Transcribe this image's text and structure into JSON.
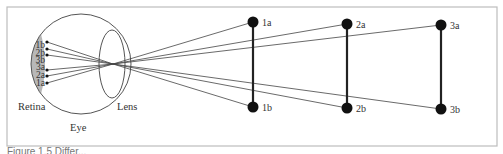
{
  "figure": {
    "frame": {
      "x": 7,
      "y": 7,
      "w": 490,
      "h": 139,
      "stroke": "#bdbdbd"
    },
    "caption": "Figure 1.5  Differ...",
    "eye": {
      "label": "Eye",
      "label_pos": [
        70,
        131
      ],
      "ball": {
        "cx": 81,
        "cy": 64,
        "r": 50
      },
      "retina": {
        "label": "Retina",
        "label_pos": [
          18,
          110
        ],
        "fill": "#b8b8b8"
      },
      "lens": {
        "label": "Lens",
        "label_pos": [
          117,
          110
        ],
        "cx": 112,
        "cy": 64,
        "rx": 13,
        "ry": 34
      },
      "nodal_point": [
        113,
        64
      ],
      "retina_points": [
        {
          "id": "1b",
          "x": 47,
          "y": 42
        },
        {
          "id": "2b",
          "x": 47,
          "y": 49
        },
        {
          "id": "3b",
          "x": 47,
          "y": 55
        },
        {
          "id": "3a",
          "x": 47,
          "y": 70
        },
        {
          "id": "2a",
          "x": 47,
          "y": 76
        },
        {
          "id": "1a",
          "x": 47,
          "y": 83
        }
      ]
    },
    "objects": [
      {
        "id": "1",
        "a": {
          "label": "1a",
          "x": 253,
          "y": 22
        },
        "b": {
          "label": "1b",
          "x": 253,
          "y": 107
        }
      },
      {
        "id": "2",
        "a": {
          "label": "2a",
          "x": 347,
          "y": 24
        },
        "b": {
          "label": "2b",
          "x": 347,
          "y": 108
        }
      },
      {
        "id": "3",
        "a": {
          "label": "3a",
          "x": 441,
          "y": 25
        },
        "b": {
          "label": "3b",
          "x": 441,
          "y": 109
        }
      }
    ],
    "colors": {
      "ray": "#444444",
      "dot": "#111111",
      "rod": "#222222",
      "outline": "#555555",
      "text": "#333333"
    }
  }
}
